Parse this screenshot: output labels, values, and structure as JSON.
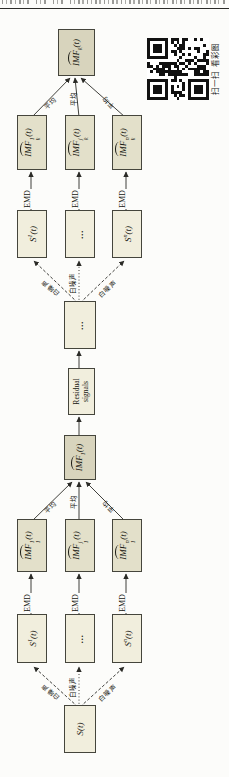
{
  "qr": {
    "caption": "扫一扫 看彩图"
  },
  "labels": {
    "emd": "EMD",
    "noise": "白噪声",
    "avg": "平均",
    "dots": "…"
  },
  "boxes": {
    "source": {
      "main": "S",
      "tail": "(t)"
    },
    "s1_1": {
      "main": "S",
      "sup": "1",
      "tail": "(t)"
    },
    "s1_n": {
      "main": "S",
      "sup": "n",
      "tail": "(t)"
    },
    "imf1_1": {
      "main": "IMF",
      "sup": "1",
      "sub": "1",
      "tail": "(t)"
    },
    "imf1_j": {
      "main": "IMF",
      "sup": "j",
      "sub": "1",
      "tail": "(t)"
    },
    "imf1_n": {
      "main": "IMF",
      "sup": "n",
      "sub": "1",
      "tail": "(t)"
    },
    "imf1": {
      "main": "IMF",
      "sub": "1",
      "tail": "(t)"
    },
    "residual": {
      "line1": "Residual",
      "line2": "signals"
    },
    "s2_1": {
      "main": "S",
      "sup": "1",
      "tail": "(t)"
    },
    "s2_n": {
      "main": "S",
      "sup": "n",
      "tail": "(t)"
    },
    "imf2_1": {
      "main": "IMF",
      "sup": "1",
      "sub": "k",
      "tail": "(t)"
    },
    "imf2_j": {
      "main": "IMF",
      "sup": "j",
      "sub": "k",
      "tail": "(t)"
    },
    "imf2_n": {
      "main": "IMF",
      "sup": "n",
      "sub": "k",
      "tail": "(t)"
    },
    "final": {
      "main": "IMF",
      "sub": "k",
      "tail": "(t)"
    }
  },
  "colors": {
    "box_fill": "#f1eedd",
    "imf_fill": "#e3e0ca",
    "result_fill": "#d8d4bd",
    "border": "#45453c",
    "line": "#2a2a26"
  }
}
